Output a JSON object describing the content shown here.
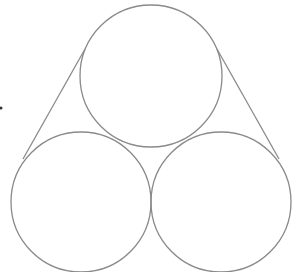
{
  "diagram": {
    "stroke_color": "#8a8a8a",
    "dot_color": "#333333",
    "circles": [
      {
        "id": "top",
        "cx": 151,
        "cy": 76,
        "r": 71
      },
      {
        "id": "bottom-left",
        "cx": 81,
        "cy": 202,
        "r": 70
      },
      {
        "id": "bottom-right",
        "cx": 221,
        "cy": 202,
        "r": 70
      }
    ],
    "tangent_lines": [
      {
        "id": "left",
        "x1": 85,
        "y1": 49,
        "x2": 23,
        "y2": 159
      },
      {
        "id": "right",
        "x1": 217,
        "y1": 49,
        "x2": 279,
        "y2": 159
      }
    ],
    "dot": {
      "cx": 1,
      "cy": 108,
      "r": 1.5
    }
  }
}
